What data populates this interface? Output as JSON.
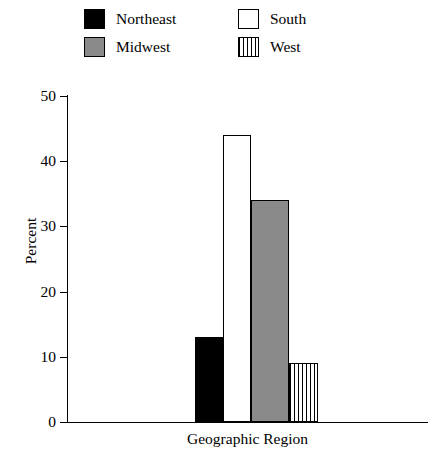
{
  "legend": {
    "entries": [
      {
        "label": "Northeast",
        "swatch": "solid-black-swatch",
        "color": "#000000"
      },
      {
        "label": "South",
        "swatch": "white-swatch",
        "color": "#ffffff"
      },
      {
        "label": "Midwest",
        "swatch": "gray-swatch",
        "color": "#8a8a8a"
      },
      {
        "label": "West",
        "swatch": "vertical-stripe-swatch",
        "color": "#ffffff"
      }
    ]
  },
  "axes": {
    "y_title": "Percent",
    "x_title": "Geographic Region",
    "y_ticks": [
      "0",
      "10",
      "20",
      "30",
      "40",
      "50"
    ]
  },
  "chart_data": {
    "type": "bar",
    "title": "",
    "xlabel": "Geographic Region",
    "ylabel": "Percent",
    "categories": [
      "Northeast",
      "South",
      "Midwest",
      "West"
    ],
    "values": [
      13,
      44,
      34,
      9
    ],
    "ylim": [
      0,
      50
    ],
    "ytick_values": [
      0,
      10,
      20,
      30,
      40,
      50
    ],
    "grid": false,
    "legend_position": "top",
    "bar_styles": [
      "solid black",
      "white with black outline",
      "solid gray",
      "vertical stripes"
    ]
  }
}
